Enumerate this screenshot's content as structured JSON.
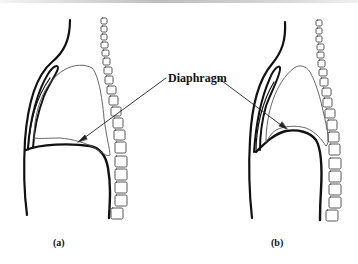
{
  "figure": {
    "center_label": "Diaphragm",
    "panels": [
      {
        "id": "a",
        "caption": "(a)",
        "description": "Sagittal section: diaphragm flattened/lowered"
      },
      {
        "id": "b",
        "caption": "(b)",
        "description": "Sagittal section: diaphragm domed/raised"
      }
    ]
  },
  "colors": {
    "line": "#111111",
    "lung_outline": "#555555",
    "vertebra_outline": "#444444",
    "background": "#ffffff"
  }
}
